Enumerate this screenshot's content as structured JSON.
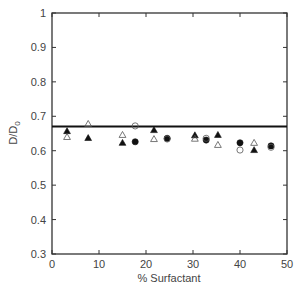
{
  "chart_data": {
    "type": "scatter",
    "title": "",
    "xlabel": "% Surfactant",
    "ylabel": "D/D",
    "ylabel_subscript": "0",
    "xlim": [
      0,
      50
    ],
    "ylim": [
      0.3,
      1.0
    ],
    "xticks": [
      0,
      10,
      20,
      30,
      40,
      50
    ],
    "xtick_labels": [
      "0",
      "10",
      "20",
      "30",
      "40",
      "50"
    ],
    "yticks": [
      0.3,
      0.4,
      0.5,
      0.6,
      0.7,
      0.8,
      0.9,
      1.0
    ],
    "ytick_labels": [
      "0.3",
      "0.4",
      "0.5",
      "0.6",
      "0.7",
      "0.8",
      "0.9",
      "1"
    ],
    "grid": false,
    "legend": null,
    "reference_line": {
      "y": 0.67,
      "color": "#111111"
    },
    "series": [
      {
        "name": "filled-triangle",
        "marker": "triangle",
        "filled": true,
        "color": "#111111",
        "points": [
          [
            3.2,
            0.657
          ],
          [
            7.7,
            0.637
          ],
          [
            15.0,
            0.623
          ],
          [
            21.7,
            0.66
          ],
          [
            30.4,
            0.645
          ],
          [
            35.3,
            0.646
          ],
          [
            43.0,
            0.602
          ]
        ]
      },
      {
        "name": "open-triangle",
        "marker": "triangle",
        "filled": false,
        "color": "#555555",
        "points": [
          [
            3.2,
            0.64
          ],
          [
            7.7,
            0.678
          ],
          [
            15.0,
            0.646
          ],
          [
            21.7,
            0.634
          ],
          [
            30.4,
            0.635
          ],
          [
            35.3,
            0.617
          ],
          [
            43.0,
            0.623
          ]
        ]
      },
      {
        "name": "filled-circle",
        "marker": "circle",
        "filled": true,
        "color": "#111111",
        "points": [
          [
            17.7,
            0.626
          ],
          [
            24.5,
            0.636
          ],
          [
            32.8,
            0.631
          ],
          [
            40.0,
            0.623
          ],
          [
            46.6,
            0.614
          ]
        ]
      },
      {
        "name": "open-circle",
        "marker": "circle",
        "filled": false,
        "color": "#555555",
        "points": [
          [
            17.7,
            0.672
          ],
          [
            24.5,
            0.634
          ],
          [
            32.8,
            0.636
          ],
          [
            40.0,
            0.602
          ],
          [
            46.6,
            0.61
          ]
        ]
      }
    ]
  }
}
